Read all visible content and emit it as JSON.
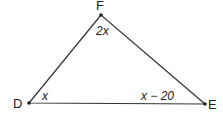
{
  "diagram": {
    "type": "triangle",
    "vertices": [
      {
        "name": "F",
        "x": 101,
        "y": 15
      },
      {
        "name": "D",
        "x": 29,
        "y": 103
      },
      {
        "name": "E",
        "x": 205,
        "y": 104
      }
    ],
    "angle_labels": {
      "F": "2x",
      "D": "x",
      "E": "x − 20"
    },
    "vertex_labels": {
      "F": "F",
      "D": "D",
      "E": "E"
    }
  }
}
